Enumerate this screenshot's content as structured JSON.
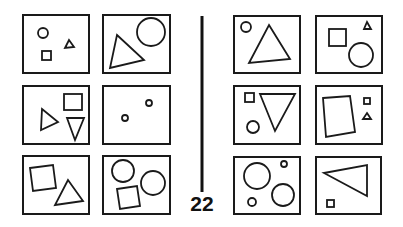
{
  "problem": {
    "number": "22",
    "type": "Bongard problem",
    "colors": {
      "stroke": "#1a1a1a",
      "background": "#ffffff"
    }
  },
  "left_panels": [
    {
      "id": "L1",
      "shapes": [
        "small-circle",
        "small-square",
        "small-triangle"
      ]
    },
    {
      "id": "L2",
      "shapes": [
        "large-triangle",
        "large-circle"
      ]
    },
    {
      "id": "L3",
      "shapes": [
        "medium-triangle",
        "medium-square",
        "medium-inverted-triangle"
      ]
    },
    {
      "id": "L4",
      "shapes": [
        "tiny-circle",
        "tiny-circle"
      ]
    },
    {
      "id": "L5",
      "shapes": [
        "large-square",
        "large-triangle"
      ]
    },
    {
      "id": "L6",
      "shapes": [
        "large-circle",
        "large-circle",
        "large-square"
      ]
    }
  ],
  "right_panels": [
    {
      "id": "R1",
      "shapes": [
        "small-circle",
        "large-triangle"
      ]
    },
    {
      "id": "R2",
      "shapes": [
        "medium-square",
        "tiny-triangle",
        "large-circle"
      ]
    },
    {
      "id": "R3",
      "shapes": [
        "small-square",
        "large-inverted-triangle",
        "small-circle"
      ]
    },
    {
      "id": "R4",
      "shapes": [
        "large-quadrilateral",
        "tiny-square",
        "tiny-triangle"
      ]
    },
    {
      "id": "R5",
      "shapes": [
        "large-circle",
        "tiny-circle",
        "small-circle",
        "large-circle"
      ]
    },
    {
      "id": "R6",
      "shapes": [
        "large-triangle",
        "small-square"
      ]
    }
  ]
}
